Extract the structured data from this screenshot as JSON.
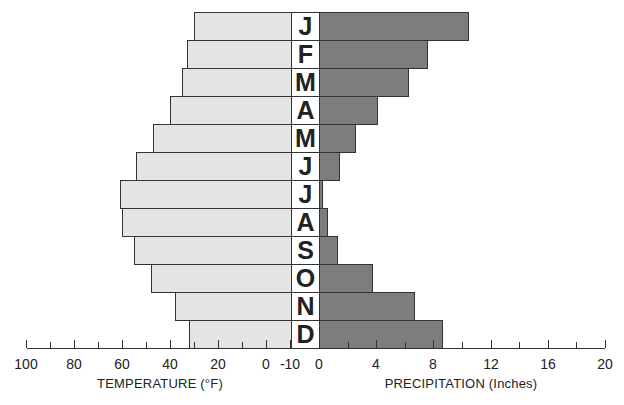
{
  "chart_data": {
    "type": "bar",
    "orientation": "horizontal-butterfly",
    "categories": [
      "J",
      "F",
      "M",
      "A",
      "M",
      "J",
      "J",
      "A",
      "S",
      "O",
      "N",
      "D"
    ],
    "series": [
      {
        "name": "Temperature",
        "unit": "°F",
        "side": "left",
        "color": "#e4e4e4",
        "values": [
          30,
          33,
          35,
          40,
          47,
          54,
          61,
          60,
          55,
          48,
          38,
          32
        ]
      },
      {
        "name": "Precipitation",
        "unit": "Inches",
        "side": "right",
        "color": "#7d7d7d",
        "values": [
          10.5,
          7.6,
          6.3,
          4.1,
          2.6,
          1.5,
          0.3,
          0.6,
          1.3,
          3.8,
          6.7,
          8.7
        ]
      }
    ],
    "title": "",
    "left_axis": {
      "label": "TEMPERATURE (°F)",
      "ticks": [
        "100",
        "80",
        "60",
        "40",
        "20",
        "0",
        "-10"
      ],
      "range": [
        100,
        -10
      ]
    },
    "right_axis": {
      "label": "PRECIPITATION (Inches)",
      "ticks": [
        "0",
        "4",
        "8",
        "12",
        "16",
        "20"
      ],
      "range": [
        0,
        20
      ]
    },
    "grid": false,
    "legend": "none"
  },
  "axes": {
    "temperature_label": "TEMPERATURE (°F)",
    "precipitation_label": "PRECIPITATION (Inches)",
    "temperature_ticks": [
      {
        "label": "100",
        "value": 100
      },
      {
        "label": "80",
        "value": 80
      },
      {
        "label": "60",
        "value": 60
      },
      {
        "label": "40",
        "value": 40
      },
      {
        "label": "20",
        "value": 20
      },
      {
        "label": "0",
        "value": 0
      },
      {
        "label": "-10",
        "value": -10
      }
    ],
    "precipitation_ticks": [
      {
        "label": "0",
        "value": 0
      },
      {
        "label": "4",
        "value": 4
      },
      {
        "label": "8",
        "value": 8
      },
      {
        "label": "12",
        "value": 12
      },
      {
        "label": "16",
        "value": 16
      },
      {
        "label": "20",
        "value": 20
      }
    ]
  }
}
